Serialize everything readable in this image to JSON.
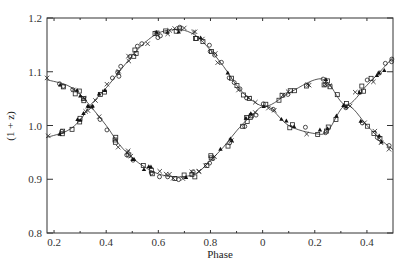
{
  "chart_data": {
    "type": "scatter",
    "title": "",
    "xlabel": "Phase",
    "ylabel": "(1 + z)",
    "xlim": [
      0.173,
      1.5
    ],
    "ylim": [
      0.8,
      1.2
    ],
    "grid": false,
    "legend": null,
    "x_ticks": [
      {
        "pos": 0.2,
        "label": "0.2"
      },
      {
        "pos": 0.4,
        "label": "0.4"
      },
      {
        "pos": 0.6,
        "label": "0.6"
      },
      {
        "pos": 0.8,
        "label": "0.8"
      },
      {
        "pos": 1.0,
        "label": "0"
      },
      {
        "pos": 1.2,
        "label": "0.2"
      },
      {
        "pos": 1.4,
        "label": "0.4"
      }
    ],
    "x_minor_ticks": [
      0.3,
      0.5,
      0.7,
      0.9,
      1.1,
      1.3
    ],
    "y_ticks": [
      {
        "pos": 0.8,
        "label": "0.8"
      },
      {
        "pos": 0.9,
        "label": "0.9"
      },
      {
        "pos": 1.0,
        "label": "1.0"
      },
      {
        "pos": 1.1,
        "label": "1.1"
      },
      {
        "pos": 1.2,
        "label": "1.2"
      }
    ],
    "series": [
      {
        "name": "component-A-fit",
        "style": "line",
        "x": [
          0.173,
          0.25,
          0.3,
          0.338,
          0.4,
          0.45,
          0.5,
          0.55,
          0.6,
          0.65,
          0.7,
          0.75,
          0.8,
          0.85,
          0.9,
          0.95,
          1.015,
          1.1,
          1.2,
          1.25,
          1.32,
          1.4,
          1.45,
          1.5
        ],
        "values": [
          0.978,
          0.99,
          1.01,
          1.037,
          1.07,
          1.1,
          1.13,
          1.155,
          1.172,
          1.178,
          1.177,
          1.165,
          1.14,
          1.11,
          1.075,
          1.05,
          1.036,
          1.06,
          1.085,
          1.08,
          1.038,
          1.075,
          1.1,
          1.127
        ]
      },
      {
        "name": "component-B-fit",
        "style": "line",
        "x": [
          0.173,
          0.25,
          0.3,
          0.338,
          0.4,
          0.45,
          0.5,
          0.55,
          0.6,
          0.65,
          0.7,
          0.75,
          0.8,
          0.85,
          0.9,
          0.95,
          1.015,
          1.1,
          1.2,
          1.25,
          1.32,
          1.4,
          1.45,
          1.5
        ],
        "values": [
          1.085,
          1.075,
          1.058,
          1.037,
          1.0,
          0.965,
          0.94,
          0.922,
          0.91,
          0.905,
          0.905,
          0.912,
          0.935,
          0.96,
          0.99,
          1.015,
          1.036,
          1.0,
          0.985,
          0.99,
          1.038,
          1.0,
          0.975,
          0.955
        ]
      }
    ],
    "markers": [
      "cross",
      "triangle",
      "square",
      "circle"
    ]
  }
}
